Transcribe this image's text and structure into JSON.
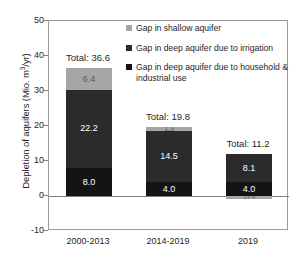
{
  "chart_data": {
    "type": "bar",
    "subtype": "stacked-bar",
    "title": "",
    "xlabel": "",
    "ylabel": "Depletion of aquifers (Mio. m3/yr)",
    "ylabel_prefix": "Depletion of aquifers (Mio. m",
    "ylabel_sup": "3",
    "ylabel_suffix": "/yr)",
    "categories": [
      "2000-2013",
      "2014-2019",
      "2019"
    ],
    "ylim": [
      -10,
      50
    ],
    "yticks": [
      50,
      40,
      30,
      20,
      10,
      0,
      -10
    ],
    "ytick_labels": [
      "50",
      "40",
      "30",
      "20",
      "10",
      "0",
      "-10"
    ],
    "grid": false,
    "legend_position": "upper-right-inside",
    "series": [
      {
        "name": "Gap in deep aquifer due to household & industrial use",
        "color": "#141414",
        "values": [
          8.0,
          4.0,
          4.0
        ],
        "labels": [
          "8.0",
          "4.0",
          "4.0"
        ]
      },
      {
        "name": "Gap in deep aquifer due to irrigation",
        "color": "#2b2b2b",
        "values": [
          22.2,
          14.5,
          8.1
        ],
        "labels": [
          "22.2",
          "14.5",
          "8.1"
        ]
      },
      {
        "name": "Gap in shallow aquifer",
        "color": "#a6a6a6",
        "values": [
          6.4,
          1.3,
          -0.9
        ],
        "labels": [
          "6.4",
          "1.3",
          "-0.9"
        ]
      }
    ],
    "totals": [
      36.6,
      19.8,
      11.2
    ],
    "total_labels": [
      "Total: 36.6",
      "Total: 19.8",
      "Total: 11.2"
    ]
  },
  "legend": {
    "items": [
      {
        "label": "Gap in shallow aquifer",
        "color": "#a6a6a6"
      },
      {
        "label": "Gap in deep aquifer due to irrigation",
        "color": "#2b2b2b"
      },
      {
        "label": "Gap in deep aquifer due to household & industrial use",
        "color": "#141414"
      }
    ]
  },
  "colors": {
    "shallow_aquifer": "#a6a6a6",
    "deep_irrigation": "#2b2b2b",
    "deep_household": "#141414",
    "axis": "#9a9a9a",
    "zero_line": "#7f7f7f",
    "text": "#262626",
    "background": "#ffffff"
  }
}
